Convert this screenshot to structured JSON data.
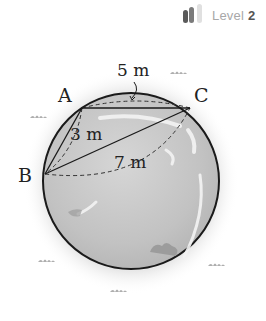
{
  "level_badge": {
    "label": "Level",
    "value": "2",
    "icon": "signal-bars-icon",
    "bars_filled": 2,
    "bars_total": 3
  },
  "diagram": {
    "points": {
      "A": "A",
      "B": "B",
      "C": "C"
    },
    "segments": {
      "AC": "5 m",
      "AB": "3 m",
      "BC": "7 m"
    },
    "colors": {
      "outline": "#1a1a1a",
      "fill": "#c8c8c8",
      "background": "#ffffff"
    }
  }
}
